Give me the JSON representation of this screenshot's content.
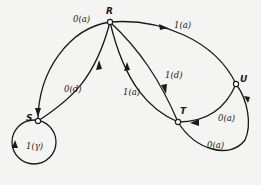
{
  "diagram": {
    "type": "state-transition-graph",
    "nodes": [
      {
        "id": "R",
        "label": "R"
      },
      {
        "id": "S",
        "label": "S"
      },
      {
        "id": "T",
        "label": "T"
      },
      {
        "id": "U",
        "label": "U"
      }
    ],
    "edges": [
      {
        "from": "R",
        "to": "S",
        "label": "0(a)"
      },
      {
        "from": "S",
        "to": "R",
        "label": "0(d)"
      },
      {
        "from": "T",
        "to": "R",
        "label": "1(a)"
      },
      {
        "from": "R",
        "to": "T",
        "label": "1(d)"
      },
      {
        "from": "R",
        "to": "U",
        "label": "1(a)"
      },
      {
        "from": "U",
        "to": "T",
        "label": "0(a)"
      },
      {
        "from": "T",
        "to": "U",
        "label": "0(a)"
      },
      {
        "from": "S",
        "to": "S",
        "label": "1(γ)"
      }
    ]
  }
}
